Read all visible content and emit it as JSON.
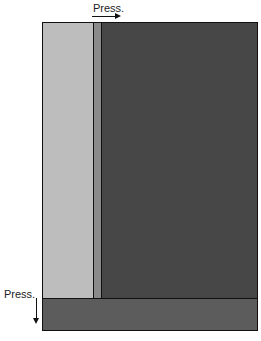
{
  "labels": {
    "top": "Press.",
    "side": "Press."
  },
  "colors": {
    "light_column": "#bdbdbd",
    "divider_column": "#8a8a8a",
    "dark_panel": "#474747",
    "bottom_bar": "#5c5c5c"
  }
}
